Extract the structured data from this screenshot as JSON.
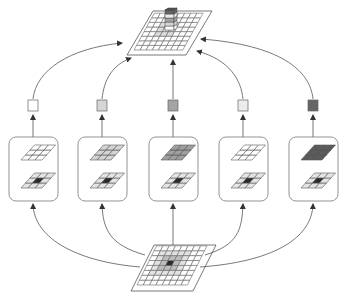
{
  "diagram": {
    "type": "convolution-neighborhood-aggregation",
    "colors": {
      "stroke": "#555555",
      "line": "#444444",
      "card_border": "#666666",
      "center_dark": "#2a2a2a",
      "neighbor_light": "#cfcfcf"
    },
    "input_plane": {
      "grid": 8,
      "center_cell": "dark",
      "neighbors": "light-gray"
    },
    "output_plane": {
      "grid": 8,
      "stacked_block": true
    },
    "branches": [
      {
        "id": 1,
        "kernel_fill": "#ffffff",
        "output_square": "#ffffff"
      },
      {
        "id": 2,
        "kernel_fill": "#d4d4d4",
        "output_square": "#d6d6d6"
      },
      {
        "id": 3,
        "kernel_fill": "#a0a0a0",
        "output_square": "#a4a4a4"
      },
      {
        "id": 4,
        "kernel_fill": "#ffffff",
        "output_square": "#ececec"
      },
      {
        "id": 5,
        "kernel_fill": "#5a5a5a",
        "output_square": "#666666"
      }
    ]
  }
}
